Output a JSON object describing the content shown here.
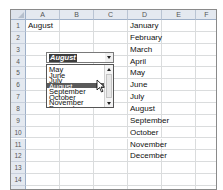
{
  "sheet": {
    "columns": [
      "A",
      "B",
      "C",
      "D",
      "E",
      "F"
    ],
    "rows": [
      "1",
      "2",
      "3",
      "4",
      "5",
      "6",
      "7",
      "8",
      "9",
      "10",
      "11",
      "12",
      "13",
      "14",
      "15"
    ],
    "cells": {
      "A1": "August",
      "D1": "January",
      "D2": "February",
      "D3": "March",
      "D4": "April",
      "D5": "May",
      "D6": "June",
      "D7": "July",
      "D8": "August",
      "D9": "September",
      "D10": "October",
      "D11": "November",
      "D12": "December"
    }
  },
  "combo_box": {
    "value": "August",
    "visible_options": [
      "May",
      "June",
      "July",
      "August",
      "September",
      "October",
      "November",
      "December"
    ],
    "selected_index": 3,
    "icons": {
      "dropdown": "chevron-down-icon",
      "scroll_up": "scroll-up-arrow-icon",
      "scroll_down": "scroll-down-arrow-icon"
    }
  },
  "cursor": {
    "icon": "pointer-cursor-icon"
  },
  "colors": {
    "selection": "#5a5a5a",
    "header_bg": "#e4e9f0",
    "gridline": "#dadcdd"
  }
}
